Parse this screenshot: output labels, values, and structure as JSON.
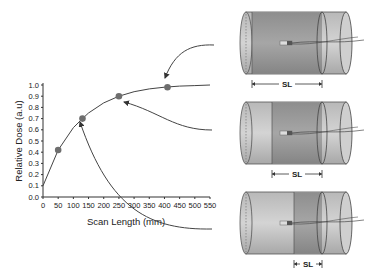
{
  "chart_data": {
    "type": "line",
    "title": "",
    "xlabel": "Scan Length (mm)",
    "ylabel": "Relative Dose (a.u)",
    "xlim": [
      0,
      550
    ],
    "ylim": [
      0.0,
      1.0
    ],
    "x_ticks": [
      "0",
      "50",
      "100",
      "150",
      "200",
      "250",
      "300",
      "350",
      "400",
      "450",
      "500",
      "550"
    ],
    "y_ticks": [
      "0.0",
      "0.1",
      "0.2",
      "0.3",
      "0.4",
      "0.5",
      "0.6",
      "0.7",
      "0.8",
      "0.9",
      "1.0"
    ],
    "grid": false,
    "series": [
      {
        "name": "Relative dose curve",
        "x": [
          0,
          50,
          100,
          130,
          150,
          200,
          250,
          300,
          350,
          400,
          450,
          500,
          550
        ],
        "y": [
          0.1,
          0.42,
          0.62,
          0.7,
          0.75,
          0.84,
          0.9,
          0.94,
          0.965,
          0.98,
          0.99,
          0.995,
          1.0
        ]
      }
    ],
    "highlighted_points": [
      {
        "x": 50,
        "y": 0.42
      },
      {
        "x": 130,
        "y": 0.7
      },
      {
        "x": 250,
        "y": 0.9
      },
      {
        "x": 410,
        "y": 0.98
      }
    ]
  },
  "diagrams": [
    {
      "label": "SL",
      "scan_length": "long"
    },
    {
      "label": "SL",
      "scan_length": "medium"
    },
    {
      "label": "SL",
      "scan_length": "short"
    }
  ]
}
